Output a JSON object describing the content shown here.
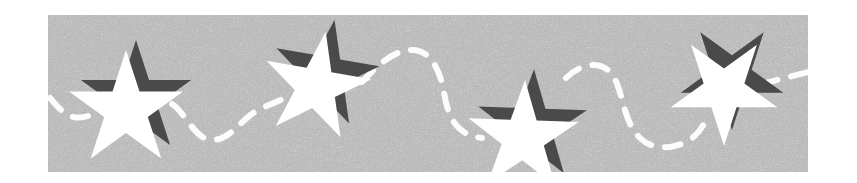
{
  "banner": {
    "description": "grainy gray decorative banner with white stars and dashed line",
    "bounds": {
      "x": 48,
      "y": 15,
      "width": 760,
      "height": 157
    },
    "colors": {
      "page_background": "#ffffff",
      "banner_fill": "#b8b8b8",
      "star_fill": "#ffffff",
      "star_shadow": "#4a4a4a",
      "dash_stroke": "#ffffff"
    },
    "stars": [
      {
        "id": "star-1",
        "cx": 128,
        "cy": 108,
        "r": 60,
        "rotation": 0
      },
      {
        "id": "star-2",
        "cx": 318,
        "cy": 84,
        "r": 56,
        "rotation": 12
      },
      {
        "id": "star-3",
        "cx": 525,
        "cy": 135,
        "r": 58,
        "rotation": 2
      },
      {
        "id": "star-4",
        "cx": 727,
        "cy": 90,
        "r": 56,
        "rotation": 180
      }
    ],
    "dashed_path": "M50,98 C60,110 70,122 88,116 M172,104 C185,112 195,140 212,140 C232,140 240,118 262,108 L290,96 M362,82 C375,68 392,50 412,50 C432,50 440,72 444,92 C448,120 458,135 482,138 M566,78 C578,66 598,58 612,74 C624,92 622,120 640,138 C652,150 672,150 690,140 C700,132 704,125 706,118 M762,84 L808,72"
  }
}
